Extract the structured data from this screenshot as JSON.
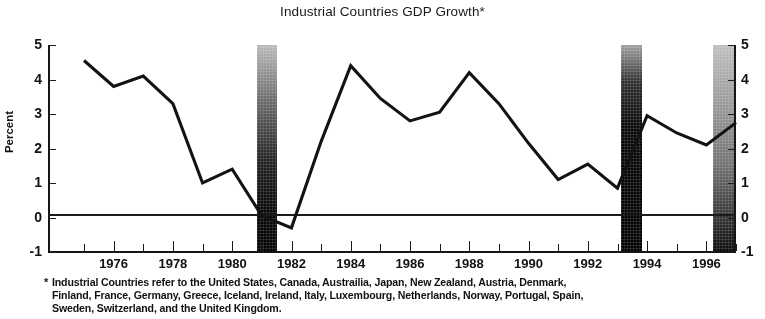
{
  "chart_data": {
    "type": "line",
    "title": "Industrial Countries GDP Growth*",
    "xlabel": "",
    "ylabel": "Percent",
    "ylim": [
      -1,
      5
    ],
    "xlim": [
      1975,
      1997
    ],
    "grid": false,
    "legend": null,
    "y_ticks": [
      "5",
      "4",
      "3",
      "2",
      "1",
      "0",
      "-1"
    ],
    "y_tick_values": [
      5,
      4,
      3,
      2,
      1,
      0,
      -1
    ],
    "x_ticks": [
      "1976",
      "1978",
      "1980",
      "1982",
      "1984",
      "1986",
      "1988",
      "1990",
      "1992",
      "1994",
      "1996"
    ],
    "x_tick_values": [
      1976,
      1978,
      1980,
      1982,
      1984,
      1986,
      1988,
      1990,
      1992,
      1994,
      1996
    ],
    "x_minor_ticks": [
      1975,
      1977,
      1979,
      1981,
      1983,
      1985,
      1987,
      1989,
      1991,
      1993,
      1995,
      1997
    ],
    "series": [
      {
        "name": "Industrial Countries GDP Growth",
        "x": [
          1975,
          1976,
          1977,
          1978,
          1979,
          1980,
          1981,
          1982,
          1983,
          1984,
          1985,
          1986,
          1987,
          1988,
          1989,
          1990,
          1991,
          1992,
          1993,
          1994,
          1995,
          1996,
          1997
        ],
        "values": [
          4.55,
          3.8,
          4.1,
          3.3,
          1.0,
          1.4,
          0.05,
          -0.3,
          2.2,
          4.4,
          3.45,
          2.8,
          3.05,
          4.2,
          3.3,
          2.15,
          1.1,
          1.55,
          0.85,
          2.95,
          2.45,
          2.1,
          2.75
        ]
      }
    ],
    "shaded_bands": [
      {
        "label": "band-1982",
        "x_start": 1981.95,
        "x_end": 1982.6
      },
      {
        "label": "band-1994",
        "x_start": 1993.5,
        "x_end": 1994.2
      },
      {
        "label": "band-1997",
        "x_start": 1996.45,
        "x_end": 1997.15
      }
    ],
    "zero_line": 0,
    "annotations": []
  },
  "footnote": {
    "marker": "*",
    "line1": "Industrial Countries refer to the United States, Canada, Austrailia, Japan, New Zealand, Austria, Denmark,",
    "line2": "Finland, France, Germany, Greece, Iceland, Ireland, Italy, Luxembourg, Netherlands, Norway, Portugal, Spain,",
    "line3": "Sweden, Switzerland, and the United Kingdom."
  },
  "colors": {
    "line": "#131313",
    "axis": "#161616",
    "band": "#0a0a0a",
    "background": "#ffffff",
    "text": "#111111"
  }
}
